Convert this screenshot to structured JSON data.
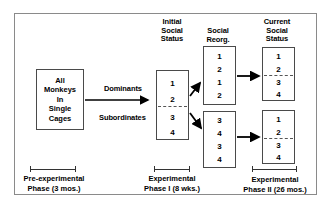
{
  "columns": {
    "initial": "Initial\nSocial\nStatus",
    "initial_lines": [
      "Initial",
      "Social",
      "Status"
    ],
    "reorg_lines": [
      "Social",
      "Reorg."
    ],
    "current_lines": [
      "Current",
      "Social",
      "Status"
    ]
  },
  "start_box": {
    "lines": [
      "All",
      "Monkeys",
      "In",
      "Single",
      "Cages"
    ]
  },
  "group_labels": {
    "dominants": "Dominants",
    "subordinates": "Subordinates"
  },
  "boxes": {
    "initial_status": {
      "values": [
        "1",
        "2",
        "3",
        "4"
      ],
      "divider_after": 2
    },
    "reorg_top": {
      "values": [
        "1",
        "2",
        "1",
        "2"
      ],
      "divider_after": null
    },
    "reorg_bottom": {
      "values": [
        "3",
        "4",
        "3",
        "4"
      ],
      "divider_after": null
    },
    "current_top": {
      "values": [
        "1",
        "2",
        "3",
        "4"
      ],
      "divider_after": 2
    },
    "current_bottom": {
      "values": [
        "1",
        "2",
        "3",
        "4"
      ],
      "divider_after": 2
    }
  },
  "captions": {
    "pre": [
      "Pre-experimental",
      "Phase (3 mos.)"
    ],
    "phase1": [
      "Experimental",
      "Phase I (8 wks.)"
    ],
    "phase2": [
      "Experimental",
      "Phase II (26 mos.)"
    ]
  },
  "colors": {
    "frame": "#8a8a8a",
    "box_border": "#4a4a4a",
    "text": "#000000",
    "arrow": "#000000",
    "divider": "#555555"
  }
}
